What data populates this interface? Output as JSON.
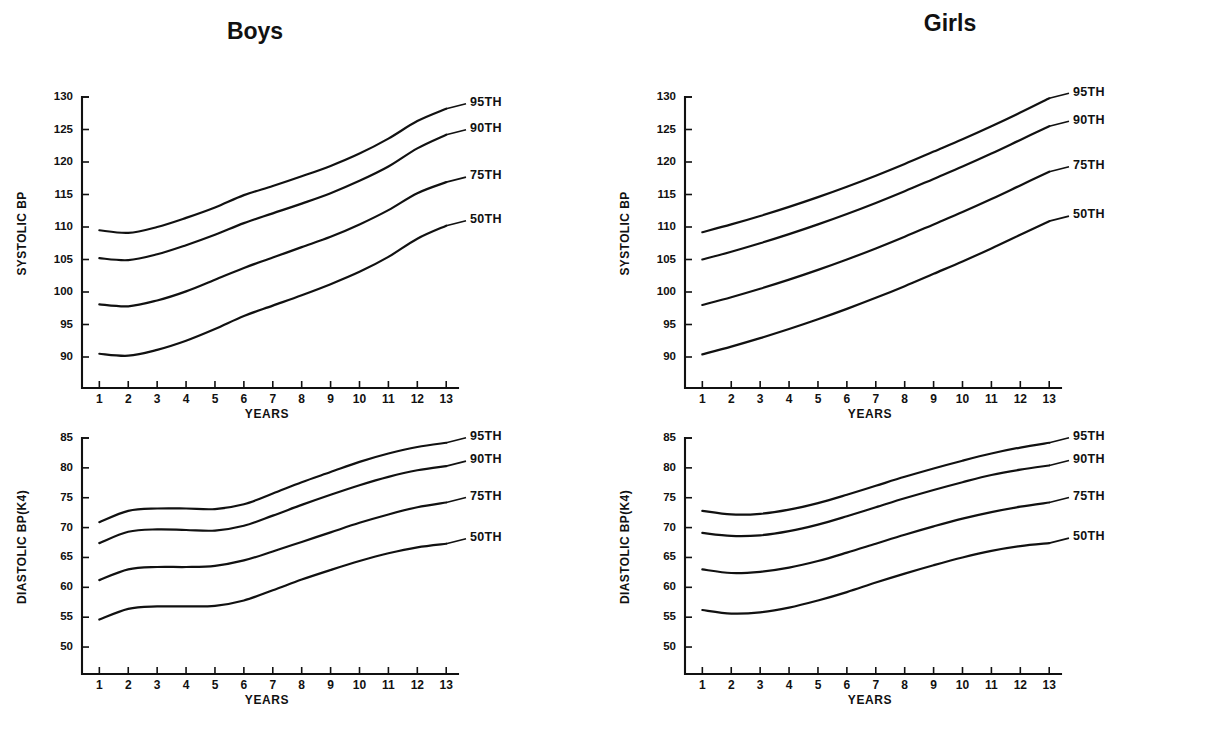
{
  "figure": {
    "panels": [
      {
        "id": "boys-systolic",
        "group_title": "Boys",
        "ylabel": "SYSTOLIC BP",
        "xlabel": "YEARS"
      },
      {
        "id": "girls-systolic",
        "group_title": "Girls",
        "ylabel": "SYSTOLIC BP",
        "xlabel": "YEARS"
      },
      {
        "id": "boys-diastolic",
        "ylabel": "DIASTOLIC BP(K4)",
        "xlabel": "YEARS"
      },
      {
        "id": "girls-diastolic",
        "ylabel": "DIASTOLIC BP(K4)",
        "xlabel": "YEARS"
      }
    ]
  },
  "chart_data": [
    {
      "id": "boys-systolic",
      "type": "line",
      "title": "Boys",
      "xlabel": "YEARS",
      "ylabel": "SYSTOLIC BP",
      "xlim": [
        0.4,
        13.2
      ],
      "ylim": [
        88,
        130
      ],
      "xticks": [
        1,
        2,
        3,
        4,
        5,
        6,
        7,
        8,
        9,
        10,
        11,
        12,
        13
      ],
      "xtick_labels": [
        "1",
        "2",
        "3",
        "4",
        "5",
        "6",
        "7",
        "8",
        "9",
        "10",
        "11",
        "12",
        "13"
      ],
      "yticks": [
        90,
        95,
        100,
        105,
        110,
        115,
        120,
        125,
        130
      ],
      "ytick_labels": [
        "90",
        "95",
        "100",
        "105",
        "110",
        "115",
        "120",
        "125",
        "130"
      ],
      "grid": false,
      "legend_position": "right-of-curve-ends",
      "x": [
        1,
        2,
        3,
        4,
        5,
        6,
        7,
        8,
        9,
        10,
        11,
        12,
        13
      ],
      "series": [
        {
          "name": "95TH",
          "values": [
            109.5,
            109.1,
            110.0,
            111.4,
            113.0,
            114.9,
            116.3,
            117.8,
            119.4,
            121.3,
            123.6,
            126.3,
            128.2
          ]
        },
        {
          "name": "90TH",
          "values": [
            105.2,
            104.9,
            105.8,
            107.2,
            108.8,
            110.6,
            112.1,
            113.6,
            115.2,
            117.1,
            119.3,
            122.1,
            124.2
          ]
        },
        {
          "name": "75TH",
          "values": [
            98.1,
            97.8,
            98.7,
            100.1,
            101.9,
            103.7,
            105.3,
            106.9,
            108.5,
            110.4,
            112.6,
            115.2,
            116.9
          ]
        },
        {
          "name": "50TH",
          "values": [
            90.5,
            90.2,
            91.1,
            92.5,
            94.3,
            96.3,
            97.9,
            99.5,
            101.2,
            103.1,
            105.4,
            108.2,
            110.2
          ]
        }
      ]
    },
    {
      "id": "girls-systolic",
      "type": "line",
      "title": "Girls",
      "xlabel": "YEARS",
      "ylabel": "SYSTOLIC BP",
      "xlim": [
        0.4,
        13.2
      ],
      "ylim": [
        88,
        130
      ],
      "xticks": [
        1,
        2,
        3,
        4,
        5,
        6,
        7,
        8,
        9,
        10,
        11,
        12,
        13
      ],
      "xtick_labels": [
        "1",
        "2",
        "3",
        "4",
        "5",
        "6",
        "7",
        "8",
        "9",
        "10",
        "11",
        "12",
        "13"
      ],
      "yticks": [
        90,
        95,
        100,
        105,
        110,
        115,
        120,
        125,
        130
      ],
      "ytick_labels": [
        "90",
        "95",
        "100",
        "105",
        "110",
        "115",
        "120",
        "125",
        "130"
      ],
      "grid": false,
      "legend_position": "right-of-curve-ends",
      "x": [
        1,
        2,
        3,
        4,
        5,
        6,
        7,
        8,
        9,
        10,
        11,
        12,
        13
      ],
      "series": [
        {
          "name": "95TH",
          "values": [
            109.2,
            110.4,
            111.7,
            113.1,
            114.6,
            116.2,
            117.9,
            119.7,
            121.6,
            123.5,
            125.5,
            127.6,
            129.8
          ]
        },
        {
          "name": "90TH",
          "values": [
            105.0,
            106.2,
            107.5,
            108.9,
            110.4,
            112.0,
            113.7,
            115.5,
            117.4,
            119.3,
            121.3,
            123.4,
            125.5
          ]
        },
        {
          "name": "75TH",
          "values": [
            98.0,
            99.2,
            100.5,
            101.9,
            103.4,
            105.0,
            106.7,
            108.5,
            110.4,
            112.3,
            114.3,
            116.4,
            118.5
          ]
        },
        {
          "name": "50TH",
          "values": [
            90.4,
            91.6,
            92.9,
            94.3,
            95.8,
            97.4,
            99.1,
            100.9,
            102.8,
            104.7,
            106.7,
            108.8,
            110.9
          ]
        }
      ]
    },
    {
      "id": "boys-diastolic",
      "type": "line",
      "title": "",
      "xlabel": "YEARS",
      "ylabel": "DIASTOLIC BP(K4)",
      "xlim": [
        0.4,
        13.2
      ],
      "ylim": [
        48.5,
        85
      ],
      "xticks": [
        1,
        2,
        3,
        4,
        5,
        6,
        7,
        8,
        9,
        10,
        11,
        12,
        13
      ],
      "xtick_labels": [
        "1",
        "2",
        "3",
        "4",
        "5",
        "6",
        "7",
        "8",
        "9",
        "10",
        "11",
        "12",
        "13"
      ],
      "yticks": [
        50,
        55,
        60,
        65,
        70,
        75,
        80,
        85
      ],
      "ytick_labels": [
        "50",
        "55",
        "60",
        "65",
        "70",
        "75",
        "80",
        "85"
      ],
      "grid": false,
      "legend_position": "right-of-curve-ends",
      "x": [
        1,
        2,
        3,
        4,
        5,
        6,
        7,
        8,
        9,
        10,
        11,
        12,
        13
      ],
      "series": [
        {
          "name": "95TH",
          "values": [
            70.9,
            72.8,
            73.2,
            73.2,
            73.1,
            73.9,
            75.7,
            77.6,
            79.3,
            81.0,
            82.4,
            83.5,
            84.2
          ]
        },
        {
          "name": "90TH",
          "values": [
            67.4,
            69.3,
            69.7,
            69.6,
            69.5,
            70.3,
            72.0,
            73.8,
            75.5,
            77.1,
            78.5,
            79.6,
            80.3
          ]
        },
        {
          "name": "75TH",
          "values": [
            61.2,
            63.0,
            63.4,
            63.4,
            63.6,
            64.5,
            66.0,
            67.6,
            69.2,
            70.8,
            72.2,
            73.4,
            74.2
          ]
        },
        {
          "name": "50TH",
          "values": [
            54.6,
            56.4,
            56.8,
            56.8,
            56.9,
            57.8,
            59.5,
            61.3,
            62.9,
            64.4,
            65.7,
            66.7,
            67.3
          ]
        }
      ]
    },
    {
      "id": "girls-diastolic",
      "type": "line",
      "title": "",
      "xlabel": "YEARS",
      "ylabel": "DIASTOLIC BP(K4)",
      "xlim": [
        0.4,
        13.2
      ],
      "ylim": [
        48.5,
        85
      ],
      "xticks": [
        1,
        2,
        3,
        4,
        5,
        6,
        7,
        8,
        9,
        10,
        11,
        12,
        13
      ],
      "xtick_labels": [
        "1",
        "2",
        "3",
        "4",
        "5",
        "6",
        "7",
        "8",
        "9",
        "10",
        "11",
        "12",
        "13"
      ],
      "yticks": [
        50,
        55,
        60,
        65,
        70,
        75,
        80,
        85
      ],
      "ytick_labels": [
        "50",
        "55",
        "60",
        "65",
        "70",
        "75",
        "80",
        "85"
      ],
      "grid": false,
      "legend_position": "right-of-curve-ends",
      "x": [
        1,
        2,
        3,
        4,
        5,
        6,
        7,
        8,
        9,
        10,
        11,
        12,
        13
      ],
      "series": [
        {
          "name": "95TH",
          "values": [
            72.8,
            72.2,
            72.3,
            73.0,
            74.1,
            75.5,
            77.0,
            78.5,
            79.9,
            81.2,
            82.4,
            83.4,
            84.2
          ]
        },
        {
          "name": "90TH",
          "values": [
            69.1,
            68.6,
            68.7,
            69.4,
            70.5,
            71.9,
            73.4,
            74.9,
            76.3,
            77.6,
            78.8,
            79.7,
            80.4
          ]
        },
        {
          "name": "75TH",
          "values": [
            63.0,
            62.4,
            62.6,
            63.3,
            64.4,
            65.8,
            67.3,
            68.8,
            70.2,
            71.5,
            72.6,
            73.5,
            74.2
          ]
        },
        {
          "name": "50TH",
          "values": [
            56.2,
            55.6,
            55.8,
            56.6,
            57.8,
            59.2,
            60.8,
            62.3,
            63.7,
            65.0,
            66.1,
            66.9,
            67.4
          ]
        }
      ]
    }
  ]
}
